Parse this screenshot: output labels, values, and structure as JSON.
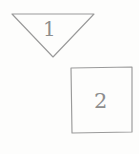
{
  "canvas": {
    "width": 139,
    "height": 154,
    "background_color": "#fdfdfc",
    "stroke_color": "#9a9a9a",
    "label_color": "#8e8e8e",
    "style": "hand-drawn-sketch"
  },
  "shapes": [
    {
      "id": "triangle",
      "name": "downward-triangle",
      "label": "1",
      "kind": "triangle",
      "orientation": "pointing-down",
      "points": "12,14 94,14 53,57",
      "bbox": {
        "x": 12,
        "y": 14,
        "width": 82,
        "height": 43
      },
      "label_position": {
        "x": 43,
        "y": 19
      }
    },
    {
      "id": "square",
      "name": "square",
      "label": "2",
      "kind": "square",
      "orientation": "upright",
      "points": "71,68 132,67 132,132 72,133",
      "bbox": {
        "x": 71,
        "y": 67,
        "width": 61,
        "height": 66
      },
      "label_position": {
        "x": 94,
        "y": 91
      }
    }
  ]
}
